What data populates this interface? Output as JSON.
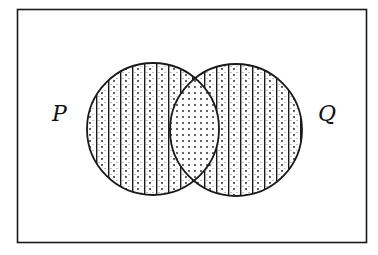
{
  "diagram": {
    "type": "venn",
    "universe": {
      "shape": "rectangle",
      "x": 17,
      "y": 9,
      "width": 349,
      "height": 233,
      "stroke": "#1a1a1a"
    },
    "sets": [
      {
        "label": "P",
        "cx": 153,
        "cy": 129,
        "r": 66,
        "label_x": 52,
        "label_y": 121,
        "shading": "vertical-lines-with-dots"
      },
      {
        "label": "Q",
        "cx": 236,
        "cy": 130,
        "r": 66,
        "label_x": 318,
        "label_y": 121,
        "shading": "vertical-lines-with-dots"
      }
    ],
    "intersection": {
      "label": "P ∩ Q",
      "shading": "dots-only"
    },
    "shaded_region_description": "P ∪ Q shaded; P ∩ Q shaded with dots only, remaining parts of P and Q shaded with vertical lines and dots",
    "colors": {
      "ink": "#1a1a1a",
      "background": "#ffffff"
    }
  }
}
